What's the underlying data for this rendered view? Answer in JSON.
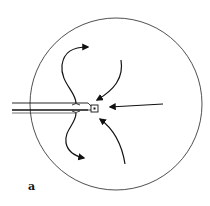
{
  "figure": {
    "panel_label": "a",
    "colors": {
      "stroke": "#111111",
      "background": "#ffffff"
    },
    "elements": {
      "boundary": "circle-outline",
      "probe": "tube-with-tip",
      "outflow_arrows": [
        "upper-curved-arrow-out",
        "lower-curved-arrow-out"
      ],
      "inflow_arrows": [
        "upper-right-curved-arrow-in",
        "straight-arrow-in",
        "lower-right-curved-arrow-in"
      ]
    }
  }
}
